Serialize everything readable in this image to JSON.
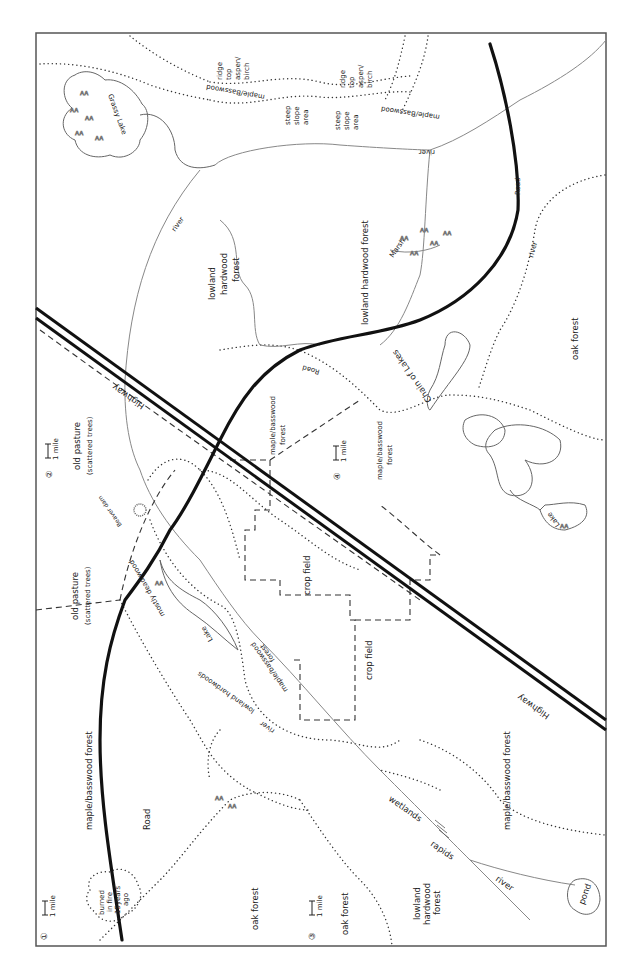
{
  "map": {
    "orientation": "rotated 90° (read with page turned clockwise)",
    "border": {
      "x": 36,
      "y": 33,
      "width": 570,
      "height": 913
    },
    "colors": {
      "road": "#111111",
      "highway": "#111111",
      "river": "#888888",
      "boundary_dotted": "#333333",
      "field_dashed": "#333333",
      "paper": "#ffffff"
    },
    "panels": [
      {
        "number": "1",
        "scale_label": "1 mile"
      },
      {
        "number": "2",
        "scale_label": "1 mile"
      },
      {
        "number": "3",
        "scale_label": "1 mile"
      },
      {
        "number": "4",
        "scale_label": "1 mile"
      }
    ],
    "features": {
      "road": "Road",
      "highway": "Highway",
      "river": "river",
      "rapids": "rapids",
      "wetlands": "wetlands",
      "lake": "Lake",
      "pond": "pond",
      "grassy_lake": "Grassy Lake",
      "marsh": "Marsh",
      "beaver_dam": "Beaver dam",
      "chain_of_lakes": "Chain of Lakes",
      "mostly_dead_wood": "mostly dead wood",
      "burned": [
        "burned",
        "in fire",
        "15years",
        "ago"
      ]
    },
    "regions": {
      "maple_basswood_forest": "maple/basswood forest",
      "maple_basswood": "maple/Basswood",
      "maple_basswood_forest_2line": [
        "maple/basswood",
        "forest"
      ],
      "oak_forest": "oak forest",
      "lowland_hardwood_forest": "lowland hardwood forest",
      "lowland_hardwood_forest_3line": [
        "lowland",
        "hardwood",
        "forest"
      ],
      "lowland_hardwoods": "lowland hardwoods",
      "old_pasture": [
        "old pasture",
        "(scattered trees)"
      ],
      "crop_field": "crop field",
      "steep_slope_area": [
        "steep",
        "slope",
        "area"
      ],
      "ridge_top": [
        "ridge",
        "top",
        "-",
        "aspen/",
        "birch"
      ]
    }
  }
}
